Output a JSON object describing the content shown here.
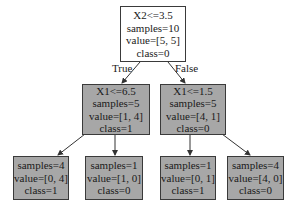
{
  "tree": {
    "root": {
      "split": "X2<=3.5",
      "samples": "samples=10",
      "value": "value=[5, 5]",
      "class": "class=0"
    },
    "edge_labels": {
      "true": "True",
      "false": "False"
    },
    "left": {
      "split": "X1<=6.5",
      "samples": "samples=5",
      "value": "value=[1, 4]",
      "class": "class=1"
    },
    "right": {
      "split": "X1<=1.5",
      "samples": "samples=5",
      "value": "value=[4, 1]",
      "class": "class=0"
    },
    "leaves": [
      {
        "samples": "samples=4",
        "value": "value=[0, 4]",
        "class": "class=1"
      },
      {
        "samples": "samples=1",
        "value": "value=[1, 0]",
        "class": "class=0"
      },
      {
        "samples": "samples=1",
        "value": "value=[0, 1]",
        "class": "class=1"
      },
      {
        "samples": "samples=4",
        "value": "value=[4, 0]",
        "class": "class=0"
      }
    ]
  },
  "colors": {
    "root_fill": "#ffffff",
    "node_fill": "#a7a7a7",
    "border": "#3a3a3a",
    "edge": "#333333"
  }
}
